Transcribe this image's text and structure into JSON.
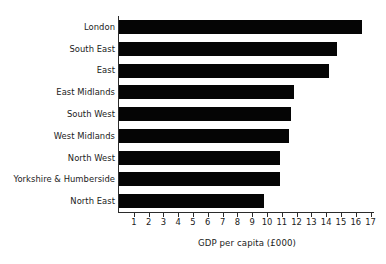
{
  "chart_data": {
    "type": "bar",
    "orientation": "horizontal",
    "title": "",
    "subtitle": "",
    "xlabel": "GDP per capita (£000)",
    "ylabel": "",
    "categories": [
      "London",
      "South East",
      "East",
      "East Midlands",
      "South West",
      "West Midlands",
      "North West",
      "Yorkshire & Humberside",
      "North East"
    ],
    "values": [
      16.4,
      14.7,
      14.2,
      11.8,
      11.6,
      11.5,
      10.9,
      10.9,
      9.8
    ],
    "xlim": [
      0,
      17.3
    ],
    "xticks": [
      1,
      2,
      3,
      4,
      5,
      6,
      7,
      8,
      9,
      10,
      11,
      12,
      13,
      14,
      15,
      16,
      17
    ],
    "xtick_labels": [
      "1",
      "2",
      "3",
      "4",
      "5",
      "6",
      "7",
      "8",
      "9",
      "10",
      "11",
      "12",
      "13",
      "14",
      "15",
      "16",
      "17"
    ],
    "grid": false,
    "legend": null,
    "bar_color": "#050505",
    "axis_color": "#2b2b2b",
    "text_color": "#1a1a1a",
    "background_color": "#ffffff"
  }
}
